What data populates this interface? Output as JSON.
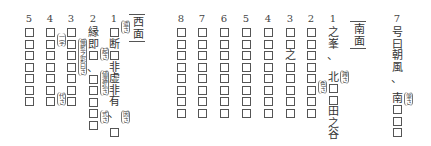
{
  "west": {
    "heading": "西面",
    "columns": [
      {
        "num": "5",
        "cells": [
          "□",
          "□",
          "□",
          "□",
          "□",
          "□",
          "□"
        ]
      },
      {
        "num": "4",
        "cells": [
          "□",
          "□",
          "□",
          "□",
          "□",
          "□",
          "□"
        ],
        "annotations": [
          "一字",
          "代さ"
        ]
      },
      {
        "num": "3",
        "cells": [
          "□",
          "□",
          "□",
          "□",
          "□",
          "□",
          "□"
        ],
        "annotations": [
          "俺藍之彩曰さ"
        ]
      },
      {
        "num": "2",
        "cells": [
          "縁",
          "即",
          "□",
          "、",
          "",
          "□",
          "□",
          "□",
          "□",
          "□"
        ],
        "annotations": [
          "起さ",
          "値遇弘さ",
          "式さ"
        ]
      },
      {
        "num": "1",
        "cells": [
          "□",
          "断",
          "□",
          "非",
          "虚",
          "非",
          "有",
          "、",
          "",
          "□"
        ],
        "annotations": [
          "遣さ",
          "因さ"
        ]
      }
    ]
  },
  "south": {
    "heading": "南面",
    "columns": [
      {
        "num": "8",
        "cells": [
          "□",
          "□",
          "□",
          "□",
          "□",
          "□",
          "□",
          "□"
        ]
      },
      {
        "num": "7",
        "cells": [
          "□",
          "□",
          "□",
          "□",
          "□",
          "□",
          "□",
          "□"
        ]
      },
      {
        "num": "6",
        "cells": [
          "□",
          "□",
          "□",
          "□",
          "□",
          "□",
          "□",
          "□"
        ]
      },
      {
        "num": "5",
        "cells": [
          "□",
          "□",
          "□",
          "□",
          "□",
          "□",
          "□",
          "□"
        ]
      },
      {
        "num": "4",
        "cells": [
          "□",
          "□",
          "□",
          "□",
          "□",
          "□",
          "□",
          "□"
        ]
      },
      {
        "num": "3",
        "cells": [
          "□",
          "□",
          "之",
          "□",
          "□",
          "□",
          "□",
          "□"
        ]
      },
      {
        "num": "2",
        "cells": [
          "□",
          "□",
          "□",
          "□",
          "□",
          "□",
          "□",
          "□"
        ],
        "annotations": [
          "色さ"
        ]
      },
      {
        "num": "1",
        "cells": [
          "之",
          "峯",
          "、",
          "",
          "北",
          "□",
          "□",
          "田",
          "之",
          "谷",
          "、"
        ],
        "annotations": [
          "跨さ"
        ]
      }
    ]
  },
  "east": {
    "columns": [
      {
        "num": "7",
        "cells": [
          "号",
          "曰",
          "朝",
          "風",
          "、",
          "",
          "南",
          "□",
          "□",
          "□"
        ],
        "annotations": [
          "肇さ"
        ]
      }
    ]
  }
}
